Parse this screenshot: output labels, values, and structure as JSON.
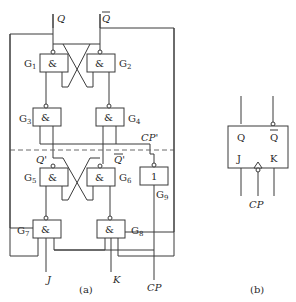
{
  "figure_a": {
    "caption": "(a)",
    "outputs": {
      "q": "Q",
      "q_bar": "Q"
    },
    "intermediate": {
      "q_prime": "Q'",
      "q_prime_bar": "Q'",
      "cp_prime": "CP'"
    },
    "inputs": {
      "j": "J",
      "k": "K",
      "cp": "CP"
    },
    "gates": [
      {
        "id": "G1",
        "name": "G",
        "sub": "1",
        "symbol": "&"
      },
      {
        "id": "G2",
        "name": "G",
        "sub": "2",
        "symbol": "&"
      },
      {
        "id": "G3",
        "name": "G",
        "sub": "3",
        "symbol": "&"
      },
      {
        "id": "G4",
        "name": "G",
        "sub": "4",
        "symbol": "&"
      },
      {
        "id": "G5",
        "name": "G",
        "sub": "5",
        "symbol": "&"
      },
      {
        "id": "G6",
        "name": "G",
        "sub": "6",
        "symbol": "&"
      },
      {
        "id": "G7",
        "name": "G",
        "sub": "7",
        "symbol": "&"
      },
      {
        "id": "G8",
        "name": "G",
        "sub": "8",
        "symbol": "&"
      },
      {
        "id": "G9",
        "name": "G",
        "sub": "9",
        "symbol": "1"
      }
    ]
  },
  "figure_b": {
    "caption": "(b)",
    "pins": {
      "q": "Q",
      "q_bar": "Q",
      "j": "J",
      "k": "K",
      "cp": "CP"
    }
  }
}
